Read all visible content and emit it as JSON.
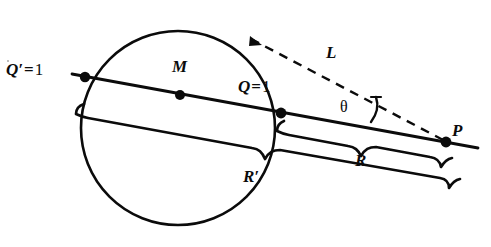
{
  "figure": {
    "kind": "geometry-diagram",
    "width": 491,
    "height": 247,
    "stroke_color": "#0b0b0b",
    "background_color": "#ffffff"
  },
  "labels": {
    "q_prime": {
      "var": "Q′",
      "op": "=",
      "value": "1",
      "text": "Q′ = 1"
    },
    "q": {
      "var": "Q",
      "op": "=",
      "value": "1",
      "text": "Q = 1"
    },
    "m": {
      "text": "M"
    },
    "p": {
      "text": "P"
    },
    "l": {
      "text": "L"
    },
    "theta": {
      "text": "θ"
    },
    "r": {
      "text": "R"
    },
    "r_prime": {
      "text": "R′"
    }
  },
  "geometry": {
    "circle": {
      "cx": 178,
      "cy": 128,
      "r": 97
    },
    "points": {
      "q_prime": {
        "x": 85,
        "y": 77,
        "marker": "filled-dot"
      },
      "m": {
        "x": 180,
        "y": 95,
        "marker": "filled-dot"
      },
      "q": {
        "x": 281,
        "y": 113,
        "marker": "filled-dot"
      },
      "p": {
        "x": 446,
        "y": 142,
        "marker": "filled-dot"
      },
      "tangent_touch": {
        "x": 257,
        "y": 43
      }
    },
    "secant_line": {
      "x1": 73,
      "y1": 75,
      "x2": 478,
      "y2": 147
    },
    "tangent_dashed": {
      "x1": 252,
      "y1": 40,
      "x2": 446,
      "y2": 142,
      "style": "dashed"
    },
    "angle_arc": {
      "label": "θ",
      "at_vertex": "p"
    },
    "brace_r": {
      "from": "q",
      "to": "p",
      "label": "R"
    },
    "brace_r_prime": {
      "from": "q_prime",
      "to": "p",
      "label": "R′"
    }
  }
}
